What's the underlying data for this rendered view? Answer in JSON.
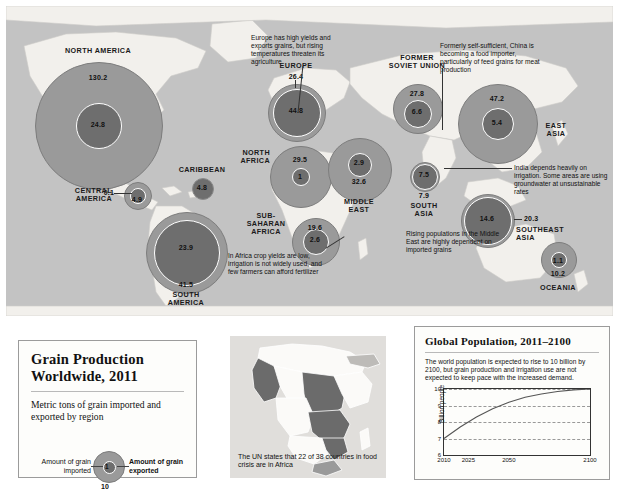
{
  "legend": {
    "title": "Grain Production Worldwide, 2011",
    "subtitle": "Metric tons of grain imported and exported by region",
    "imported_label": "Amount of grain imported",
    "exported_label": "Amount of grain exported",
    "sample_inner": "1",
    "sample_outer": "10"
  },
  "africa_panel": {
    "caption": "The UN states that 22 of 38 countries in food crisis are in Africa"
  },
  "population_panel": {
    "title": "Global Population, 2011–2100",
    "blurb": "The world population is expected to rise to 10 billion by 2100, but grain production and irrigation use are not expected to keep pace with the increased demand."
  },
  "chart_data": {
    "type": "line",
    "title": "Global Population, 2011–2100",
    "xlabel": "",
    "ylabel": "Billion people",
    "xlim": [
      2010,
      2100
    ],
    "ylim": [
      6,
      10
    ],
    "xticks": [
      2010,
      2025,
      2050,
      2100
    ],
    "xtick_labels": [
      "2010",
      "2025",
      "2050",
      "2100"
    ],
    "yticks": [
      6,
      7,
      8,
      9,
      10
    ],
    "ytick_labels": [
      "6",
      "7",
      "8",
      "9",
      "10"
    ],
    "grid": "horizontal-dashed",
    "legend": "none",
    "series": [
      {
        "name": "World population",
        "x": [
          2010,
          2020,
          2025,
          2030,
          2040,
          2050,
          2060,
          2070,
          2080,
          2090,
          2100
        ],
        "y": [
          7.0,
          7.7,
          8.0,
          8.3,
          8.8,
          9.2,
          9.5,
          9.7,
          9.85,
          9.95,
          10.0
        ]
      }
    ]
  },
  "map": {
    "regions": [
      {
        "name": "NORTH AMERICA",
        "exported": "130.2",
        "imported": "24.8"
      },
      {
        "name": "CENTRAL AMERICA",
        "exported": "0.1",
        "imported": "4.9"
      },
      {
        "name": "CARIBBEAN",
        "imported": "4.8"
      },
      {
        "name": "SOUTH AMERICA",
        "exported": "41.5",
        "imported": "23.9"
      },
      {
        "name": "EUROPE",
        "exported": "26.4",
        "imported": "44.8"
      },
      {
        "name": "NORTH AFRICA",
        "exported": "29.5",
        "imported": "1"
      },
      {
        "name": "SUB-SAHARAN AFRICA",
        "exported": "19.6",
        "imported": "2.6"
      },
      {
        "name": "FORMER SOVIET UNION",
        "exported": "27.8",
        "imported": "6.6"
      },
      {
        "name": "MIDDLE EAST",
        "exported": "32.6",
        "imported": "2.9"
      },
      {
        "name": "EAST ASIA",
        "exported": "47.2",
        "imported": "5.4"
      },
      {
        "name": "SOUTH ASIA",
        "exported": "7.9",
        "imported": "7.5"
      },
      {
        "name": "SOUTHEAST ASIA",
        "exported": "20.3",
        "imported": "14.6"
      },
      {
        "name": "OCEANIA",
        "exported": "10.2",
        "imported": "1.1"
      }
    ],
    "region_names": {
      "north_america": "NORTH AMERICA",
      "central_america_l1": "CENTRAL",
      "central_america_l2": "AMERICA",
      "caribbean": "CARIBBEAN",
      "south_america_l1": "SOUTH",
      "south_america_l2": "AMERICA",
      "europe": "EUROPE",
      "north_africa_l1": "NORTH",
      "north_africa_l2": "AFRICA",
      "sub_saharan_l1": "SUB-",
      "sub_saharan_l2": "SAHARAN",
      "sub_saharan_l3": "AFRICA",
      "fsu_l1": "FORMER",
      "fsu_l2": "SOVIET UNION",
      "middle_east_l1": "MIDDLE",
      "middle_east_l2": "EAST",
      "east_asia_l1": "EAST",
      "east_asia_l2": "ASIA",
      "south_asia_l1": "SOUTH",
      "south_asia_l2": "ASIA",
      "southeast_asia_l1": "SOUTHEAST",
      "southeast_asia_l2": "ASIA",
      "oceania": "OCEANIA"
    },
    "values": {
      "na_out": "130.2",
      "na_in": "24.8",
      "ca_out": "0.1",
      "ca_in": "4.9",
      "carib_in": "4.8",
      "sa_out": "41.5",
      "sa_in": "23.9",
      "eu_out": "26.4",
      "eu_in": "44.8",
      "nafr_out": "29.5",
      "nafr_in": "1",
      "ssa_out": "19.6",
      "ssa_in": "2.6",
      "fsu_out": "27.8",
      "fsu_in": "6.6",
      "me_out": "32.6",
      "me_in": "2.9",
      "ea_out": "47.2",
      "ea_in": "5.4",
      "sas_out": "7.9",
      "sas_in": "7.5",
      "sea_out": "20.3",
      "sea_in": "14.6",
      "oce_out": "10.2",
      "oce_in": "1.1"
    },
    "annotations": {
      "europe": "Europe has high yields and exports grains, but rising temperatures threaten its agriculture",
      "china": "Formerly self-sufficient, China is becoming a food importer, particularly of feed grains for meat production",
      "india": "India depends heavily on irrigation. Some areas are using groundwater at unsustainable rates",
      "middle_east": "Rising populations in the Middle East are highly dependent on imported grains",
      "africa": "In Africa crop yields are low, irrigation is not widely used, and few farmers can afford fertilizer"
    }
  }
}
